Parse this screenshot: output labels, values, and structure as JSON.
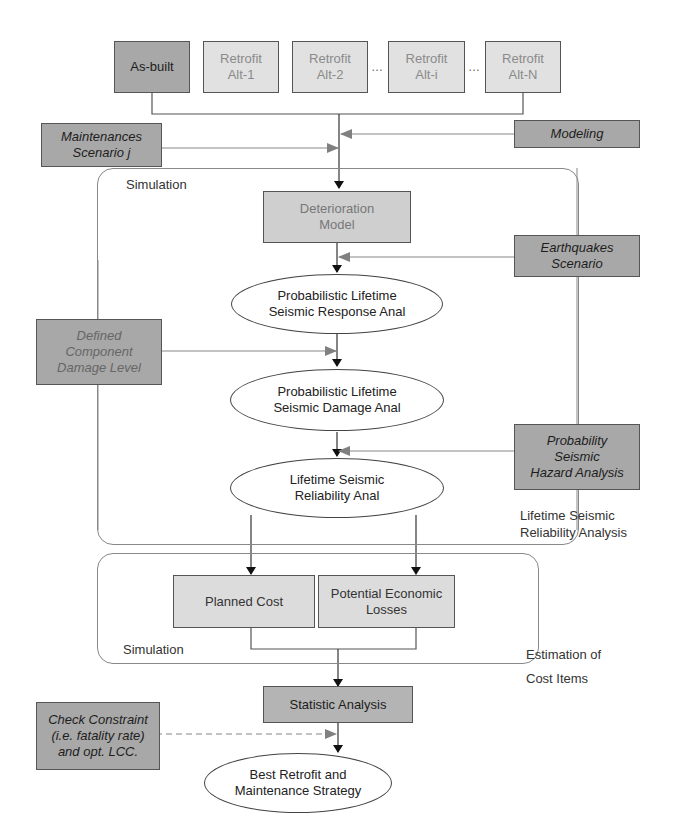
{
  "alternatives": [
    {
      "line1": "As-built",
      "line2": ""
    },
    {
      "line1": "Retrofit",
      "line2": "Alt-1"
    },
    {
      "line1": "Retrofit",
      "line2": "Alt-2"
    },
    {
      "line1": "Retrofit",
      "line2": "Alt-i"
    },
    {
      "line1": "Retrofit",
      "line2": "Alt-N"
    }
  ],
  "ellipsis": "…",
  "inputs": {
    "maintenance": {
      "line1": "Maintenances",
      "line2": "Scenario j"
    },
    "modeling": {
      "line1": "Modeling"
    },
    "earthquakes": {
      "line1": "Earthquakes",
      "line2": "Scenario"
    },
    "damage_level": {
      "line1": "Defined",
      "line2": "Component",
      "line3": "Damage Level"
    },
    "hazard": {
      "line1": "Probability",
      "line2": "Seismic",
      "line3": "Hazard Analysis"
    },
    "constraint": {
      "line1": "Check Constraint",
      "line2": "(i.e. fatality rate)",
      "line3": "and opt. LCC."
    }
  },
  "simulation_group_1": {
    "label": "Simulation",
    "caption": {
      "line1": "Lifetime Seismic",
      "line2": "Reliability Analysis"
    }
  },
  "process": {
    "deterioration": {
      "line1": "Deterioration",
      "line2": "Model"
    },
    "response": {
      "line1": "Probabilistic Lifetime",
      "line2": "Seismic Response Anal"
    },
    "damage": {
      "line1": "Probabilistic Lifetime",
      "line2": "Seismic Damage Anal"
    },
    "reliability": {
      "line1": "Lifetime Seismic",
      "line2": "Reliability Anal"
    }
  },
  "simulation_group_2": {
    "label": "Simulation",
    "caption": {
      "line1": "Estimation of",
      "line2": "Cost Items"
    },
    "planned_cost": "Planned Cost",
    "losses": {
      "line1": "Potential Economic",
      "line2": "Losses"
    }
  },
  "statistic": "Statistic Analysis",
  "result": {
    "line1": "Best Retrofit and",
    "line2": "Maintenance Strategy"
  },
  "colors": {
    "dark_box": "#a8a8a8",
    "light_box": "#dcdcdc",
    "line": "#555555",
    "arrow_input": "#7a7a7a"
  }
}
